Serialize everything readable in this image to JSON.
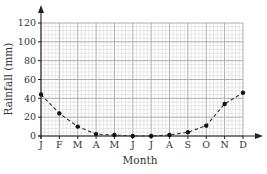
{
  "chart_data": {
    "type": "line",
    "title": "",
    "xlabel": "Month",
    "ylabel": "Rainfall (mm)",
    "categories": [
      "J",
      "F",
      "M",
      "A",
      "M",
      "J",
      "J",
      "A",
      "S",
      "O",
      "N",
      "D"
    ],
    "series": [
      {
        "name": "Rainfall",
        "values": [
          44,
          24,
          10,
          2,
          1,
          0,
          0,
          1,
          4,
          11,
          34,
          46
        ],
        "style": "dashed",
        "marker": "circle"
      }
    ],
    "ylim": [
      0,
      120
    ],
    "yticks": [
      0,
      20,
      40,
      60,
      80,
      100,
      120
    ],
    "grid": true,
    "legend": null
  },
  "colors": {
    "grid_minor": "#c8c8c8",
    "grid_major": "#9a9a9a",
    "axis": "#222222",
    "line": "#333333",
    "marker": "#111111"
  }
}
